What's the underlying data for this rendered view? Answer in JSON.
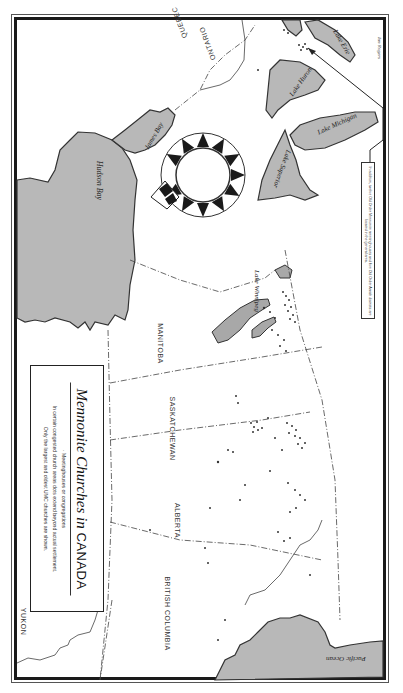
{
  "map": {
    "title_italic": "Mennonite Churches in",
    "title_caps": "CANADA",
    "legend": {
      "symbol_line": "· Meetinghouses or congregations",
      "note_line_1": "In certain congested church areas dots extend beyond actual settlement.",
      "note_line_2": "Only the largest and oldest UMC churches are shown."
    },
    "regions": [
      {
        "name": "YUKON"
      },
      {
        "name": "BRITISH COLUMBIA"
      },
      {
        "name": "ALBERTA"
      },
      {
        "name": "SASKATCHEWAN"
      },
      {
        "name": "MANITOBA"
      },
      {
        "name": "ONTARIO"
      },
      {
        "name": "QUEBEC"
      }
    ],
    "water_bodies": [
      {
        "name": "Hudson Bay"
      },
      {
        "name": "James Bay"
      },
      {
        "name": "Lake Winnipeg"
      },
      {
        "name": "Lake Superior"
      },
      {
        "name": "Lake Michigan"
      },
      {
        "name": "Lake Huron"
      },
      {
        "name": "Lake Erie"
      },
      {
        "name": "Pacific Ocean"
      }
    ],
    "inset_note": "In addition, twelve Old Order Mennonite meetinghouses and five Old Order Amish districts are located in the general area.",
    "signature": "Ian Rogers",
    "colors": {
      "water": "#b8b8b8",
      "frame": "#1a1a1a",
      "land": "#ffffff",
      "boundary": "#444444"
    },
    "orientation": "rotated 90° clockwise (north to the left)"
  }
}
